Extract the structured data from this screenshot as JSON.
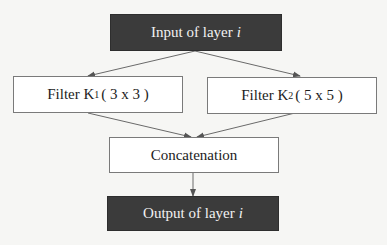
{
  "diagram": {
    "type": "flowchart",
    "nodes": {
      "input": {
        "prefix": "Input of layer",
        "var": "i",
        "style": "dark"
      },
      "filter1": {
        "prefix": "Filter K",
        "sub": "1",
        "suffix": "( 3 x 3 )",
        "style": "light"
      },
      "filter2": {
        "prefix": "Filter K",
        "sub": "2",
        "suffix": "( 5 x 5 )",
        "style": "light"
      },
      "concat": {
        "label": "Concatenation",
        "style": "light"
      },
      "output": {
        "prefix": "Output of layer",
        "var": "i",
        "style": "dark"
      }
    },
    "edges": [
      {
        "from": "input",
        "to": "filter1"
      },
      {
        "from": "input",
        "to": "filter2"
      },
      {
        "from": "filter1",
        "to": "concat"
      },
      {
        "from": "filter2",
        "to": "concat"
      },
      {
        "from": "concat",
        "to": "output"
      }
    ],
    "colors": {
      "dark_fill": "#3b3b3b",
      "dark_text": "#f2f2f2",
      "light_fill": "#ffffff",
      "border": "#7a7a7a",
      "arrow": "#666666",
      "background": "#f6f6f4"
    }
  }
}
